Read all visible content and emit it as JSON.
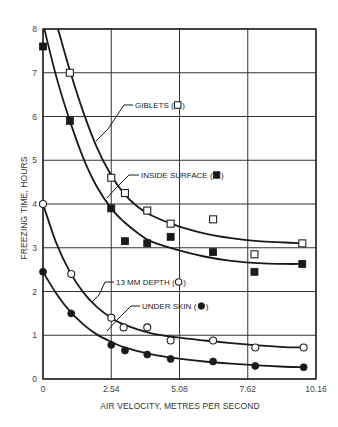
{
  "chart_data": {
    "type": "scatter",
    "title": "",
    "xlabel": "AIR VELOCITY, METRES PER SECOND",
    "ylabel": "FREEZING TIME, HOURS",
    "xlim": [
      0,
      10.16
    ],
    "ylim": [
      0,
      8
    ],
    "x_ticks": [
      0,
      2.54,
      5.08,
      7.62,
      10.16
    ],
    "x_tick_labels": [
      "0",
      "2.54",
      "5.08",
      "7.62",
      "10.16"
    ],
    "y_ticks": [
      0,
      1,
      2,
      3,
      4,
      5,
      6,
      7,
      8
    ],
    "y_tick_labels": [
      "0",
      "1",
      "2",
      "3",
      "4",
      "5",
      "6",
      "7",
      "8"
    ],
    "grid": true,
    "legend_position": "inline labels with leader lines",
    "series": [
      {
        "name": "GIBLETS",
        "marker": "open-square",
        "label": "GIBLETS (□)",
        "points": [
          [
            1.0,
            7.0
          ],
          [
            2.54,
            4.6
          ],
          [
            3.05,
            4.25
          ],
          [
            3.88,
            3.85
          ],
          [
            4.75,
            3.55
          ],
          [
            6.33,
            3.65
          ],
          [
            7.87,
            2.85
          ],
          [
            9.65,
            3.1
          ]
        ],
        "fit_curve": [
          [
            0.56,
            8.0
          ],
          [
            1.0,
            7.05
          ],
          [
            1.5,
            6.1
          ],
          [
            2.0,
            5.3
          ],
          [
            2.54,
            4.65
          ],
          [
            3.0,
            4.25
          ],
          [
            3.5,
            3.95
          ],
          [
            4.0,
            3.75
          ],
          [
            5.0,
            3.5
          ],
          [
            6.0,
            3.33
          ],
          [
            7.0,
            3.22
          ],
          [
            8.0,
            3.15
          ],
          [
            9.0,
            3.12
          ],
          [
            9.65,
            3.1
          ]
        ]
      },
      {
        "name": "INSIDE SURFACE",
        "marker": "filled-square",
        "label": "INSIDE SURFACE (■)",
        "points": [
          [
            0,
            7.6
          ],
          [
            1.0,
            5.9
          ],
          [
            2.54,
            3.9
          ],
          [
            3.05,
            3.15
          ],
          [
            3.88,
            3.1
          ],
          [
            4.75,
            3.25
          ],
          [
            6.33,
            2.9
          ],
          [
            7.87,
            2.45
          ],
          [
            9.65,
            2.63
          ]
        ],
        "fit_curve": [
          [
            0.05,
            8.0
          ],
          [
            0.5,
            6.9
          ],
          [
            1.0,
            5.9
          ],
          [
            1.5,
            5.05
          ],
          [
            2.0,
            4.4
          ],
          [
            2.54,
            3.9
          ],
          [
            3.0,
            3.6
          ],
          [
            3.5,
            3.35
          ],
          [
            4.0,
            3.15
          ],
          [
            5.0,
            2.95
          ],
          [
            6.0,
            2.8
          ],
          [
            7.0,
            2.7
          ],
          [
            8.0,
            2.65
          ],
          [
            9.0,
            2.63
          ],
          [
            9.65,
            2.63
          ]
        ]
      },
      {
        "name": "13 MM DEPTH",
        "marker": "open-circle",
        "label": "13 MM DEPTH (○)",
        "points": [
          [
            0,
            4.0
          ],
          [
            1.05,
            2.4
          ],
          [
            2.54,
            1.4
          ],
          [
            3.0,
            1.18
          ],
          [
            3.88,
            1.18
          ],
          [
            4.75,
            0.88
          ],
          [
            6.33,
            0.88
          ],
          [
            7.9,
            0.72
          ],
          [
            9.7,
            0.72
          ]
        ],
        "fit_curve": [
          [
            0,
            4.0
          ],
          [
            0.5,
            3.1
          ],
          [
            1.0,
            2.45
          ],
          [
            1.5,
            1.98
          ],
          [
            2.0,
            1.65
          ],
          [
            2.54,
            1.4
          ],
          [
            3.0,
            1.25
          ],
          [
            4.0,
            1.05
          ],
          [
            5.0,
            0.95
          ],
          [
            6.0,
            0.88
          ],
          [
            7.0,
            0.82
          ],
          [
            8.0,
            0.77
          ],
          [
            9.0,
            0.73
          ],
          [
            9.7,
            0.72
          ]
        ]
      },
      {
        "name": "UNDER SKIN",
        "marker": "filled-circle",
        "label": "UNDER SKIN (●)",
        "points": [
          [
            0,
            2.45
          ],
          [
            1.05,
            1.5
          ],
          [
            2.54,
            0.78
          ],
          [
            3.05,
            0.65
          ],
          [
            3.88,
            0.56
          ],
          [
            4.75,
            0.46
          ],
          [
            6.33,
            0.4
          ],
          [
            7.9,
            0.3
          ],
          [
            9.7,
            0.27
          ]
        ],
        "fit_curve": [
          [
            0,
            2.45
          ],
          [
            0.5,
            1.95
          ],
          [
            1.0,
            1.55
          ],
          [
            1.5,
            1.25
          ],
          [
            2.0,
            1.02
          ],
          [
            2.54,
            0.85
          ],
          [
            3.0,
            0.73
          ],
          [
            4.0,
            0.57
          ],
          [
            5.0,
            0.47
          ],
          [
            6.0,
            0.4
          ],
          [
            7.0,
            0.35
          ],
          [
            8.0,
            0.31
          ],
          [
            9.0,
            0.28
          ],
          [
            9.7,
            0.27
          ]
        ]
      }
    ]
  },
  "labels": {
    "giblets": {
      "text": "GIBLETS (",
      "x": 135,
      "y": 108,
      "leader": [
        [
          133,
          105
        ],
        [
          124,
          105
        ],
        [
          108,
          129
        ],
        [
          96,
          141
        ]
      ],
      "marker": "open-square"
    },
    "inside": {
      "text": "INSIDE SURFACE (",
      "x": 141,
      "y": 178,
      "leader": [
        [
          139,
          175
        ],
        [
          129,
          175
        ],
        [
          115,
          189
        ],
        [
          107,
          198
        ]
      ],
      "marker": "filled-square"
    },
    "depth": {
      "text": "13 MM DEPTH (",
      "x": 116,
      "y": 285,
      "leader": [
        [
          114,
          282
        ],
        [
          105,
          282
        ],
        [
          99,
          295
        ],
        [
          92,
          302
        ]
      ],
      "marker": "open-circle"
    },
    "skin": {
      "text": "UNDER SKIN",
      "x": 142,
      "y": 309,
      "leader": [
        [
          140,
          306
        ],
        [
          131,
          306
        ],
        [
          116,
          321
        ],
        [
          107,
          331
        ]
      ],
      "marker": "filled-circle"
    }
  }
}
